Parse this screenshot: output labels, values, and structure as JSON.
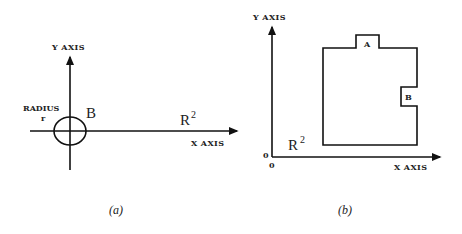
{
  "panel_a": {
    "y_axis_label": "Y AXIS",
    "x_axis_label": "X AXIS",
    "radius_label": "RADIUS",
    "radius_symbol": "r",
    "ball_label": "B",
    "space_label": "R",
    "space_exponent": "2",
    "caption": "(a)"
  },
  "panel_b": {
    "y_axis_label": "Y AXIS",
    "x_axis_label": "X AXIS",
    "origin_y_label": "0",
    "origin_x_label": "0",
    "space_label": "R",
    "space_exponent": "2",
    "region_a_label": "A",
    "region_b_label": "B",
    "caption": "(b)"
  }
}
